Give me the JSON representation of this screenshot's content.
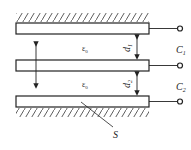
{
  "diagram": {
    "type": "three-plate capacitor",
    "labels": {
      "c_top": "C",
      "c_top_sub": "1",
      "c_bottom": "C",
      "c_bottom_sub": "2",
      "eps_top": "ε",
      "eps_top_sub": "0",
      "eps_bottom": "ε",
      "eps_bottom_sub": "0",
      "d_top": "d",
      "d_top_sub": "1",
      "d_bottom": "d",
      "d_bottom_sub": "2",
      "area": "S"
    },
    "colors": {
      "line": "#222222",
      "background": "#ffffff"
    }
  }
}
